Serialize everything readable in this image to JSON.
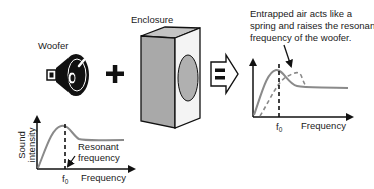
{
  "labels": {
    "woofer": "Woofer",
    "enclosure": "Enclosure",
    "plus": "+",
    "equals": "="
  },
  "caption": {
    "lines": [
      "Entrapped air acts like a",
      "spring and raises the resonant",
      "frequency of the woofer."
    ]
  },
  "left_chart": {
    "ylabel_line1": "Sound",
    "ylabel_line2": "intensity",
    "xlabel": "Frequency",
    "f_label": "f",
    "f_sub": "0",
    "annotation_line1": "Resonant",
    "annotation_line2": "frequency"
  },
  "right_chart": {
    "xlabel": "Frequency",
    "f_label": "f",
    "f_sub": "0"
  },
  "colors": {
    "curve": "#8a8a8a",
    "enclosure_side": "#a9a9a9",
    "enclosure_top": "#c4c4c4",
    "enclosure_front": "#f4f4f4",
    "enclosure_hole": "#b0b0b0",
    "ink": "#111111"
  }
}
